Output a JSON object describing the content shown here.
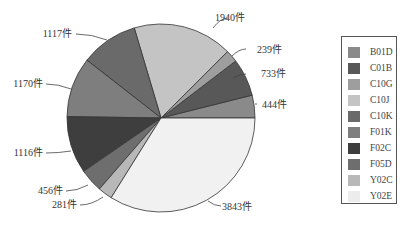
{
  "chart_data": {
    "type": "pie",
    "title": "",
    "start_angle_deg": 0,
    "direction": "counterclockwise",
    "unit_suffix": "件",
    "slices": [
      {
        "name": "B01D",
        "value": 444,
        "label": "444件",
        "color": "#8a8a8a"
      },
      {
        "name": "C01B",
        "value": 733,
        "label": "733件",
        "color": "#585858"
      },
      {
        "name": "C10G",
        "value": 239,
        "label": "239件",
        "color": "#9e9e9e"
      },
      {
        "name": "C10J",
        "value": 1940,
        "label": "1940件",
        "color": "#c4c4c4"
      },
      {
        "name": "C10K",
        "value": 1117,
        "label": "1117件",
        "color": "#6a6a6a"
      },
      {
        "name": "F01K",
        "value": 1170,
        "label": "1170件",
        "color": "#7e7e7e"
      },
      {
        "name": "F02C",
        "value": 1116,
        "label": "1116件",
        "color": "#3e3e3e"
      },
      {
        "name": "F05D",
        "value": 456,
        "label": "456件",
        "color": "#6e6e6e"
      },
      {
        "name": "Y02C",
        "value": 281,
        "label": "281件",
        "color": "#b8b8b8"
      },
      {
        "name": "Y02E",
        "value": 3843,
        "label": "3843件",
        "color": "#f1f1f1"
      }
    ],
    "legend": {
      "position": "right",
      "entries": [
        "B01D",
        "C01B",
        "C10G",
        "C10J",
        "C10K",
        "F01K",
        "F02C",
        "F05D",
        "Y02C",
        "Y02E"
      ]
    }
  }
}
